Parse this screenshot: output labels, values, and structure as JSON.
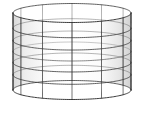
{
  "figure": {
    "title": "Hyperboloid of one sheet",
    "type": "parametric-surface-wireframe",
    "caption": "",
    "background_color": "#ffffff",
    "canvas": {
      "width": 144,
      "height": 129
    }
  },
  "chart_data": {
    "type": "line",
    "title": "Hyperboloid of one sheet",
    "subtitle": "",
    "xlabel": "",
    "ylabel": "",
    "grid": true,
    "legend": null,
    "surface": {
      "equation": "x^2/a^2 + y^2/b^2 - z^2/c^2 = 1",
      "parametrization": "x = a*cosh(v)*cos(u), y = b*cosh(v)*sin(u), z = c*sinh(v)",
      "u_range_deg": [
        0,
        360
      ],
      "v_range": [
        -1.05,
        1.05
      ],
      "u_divisions": 12,
      "v_divisions": 6,
      "a": 1.0,
      "b": 1.0,
      "c": 1.0
    },
    "projection": {
      "kind": "orthographic",
      "center_x": 72,
      "center_y": 51.5,
      "waist_radius_x": 59,
      "ring_semi_minor_y": 9.5,
      "half_height": 38.5,
      "flare_factor": 1.0,
      "top_rim_y": 13.0,
      "bottom_rim_y": 116.0,
      "waist_left_x": 13,
      "waist_right_x": 131,
      "top_left_corner": [
        17,
        14
      ],
      "top_right_corner": [
        125,
        13
      ],
      "bottom_left_corner": [
        18,
        116
      ],
      "bottom_right_corner": [
        126,
        116
      ]
    },
    "rings": {
      "count": 7,
      "labels": [
        "v=-1.05",
        "v=-0.70",
        "v=-0.35",
        "v=0.00",
        "v=0.35",
        "v=0.70",
        "v=1.05"
      ],
      "center_y": [
        17.0,
        29.0,
        41.0,
        51.5,
        62.0,
        74.0,
        86.0
      ],
      "radius_x": [
        59.0,
        47.0,
        38.0,
        34.0,
        38.0,
        47.0,
        59.0
      ]
    },
    "meridians": {
      "count": 12,
      "angles_deg": [
        0,
        30,
        60,
        90,
        120,
        150,
        180,
        210,
        240,
        270,
        300,
        330
      ]
    },
    "style": {
      "mesh_line_color": "#3a3a3a",
      "silhouette_color": "#222222",
      "surface_fill": "#ffffff",
      "shade_light": "#f2f2f2",
      "shade_mid": "#dedede",
      "shade_dark": "#c9c9c9",
      "mesh_line_width": 0.8,
      "silhouette_line_width": 1.0,
      "equator_line_color": "#6b6b6b"
    }
  },
  "a11y": {
    "figure_alt": "Wireframe drawing of a hyperboloid of one sheet: an hourglass-like surface whose left and right silhouettes curve inward toward the middle, overlaid with a mesh of horizontal elliptical rings and vertical curved generator lines.",
    "title_label": "Hyperboloid of one sheet"
  }
}
